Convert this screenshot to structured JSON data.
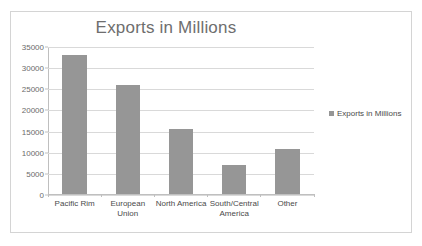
{
  "chart_data": {
    "type": "bar",
    "title": "Exports in Millions",
    "xlabel": "",
    "ylabel": "",
    "categories": [
      "Pacific Rim",
      "European Union",
      "North America",
      "South/Central America",
      "Other"
    ],
    "values": [
      33200,
      26000,
      15400,
      7000,
      10600
    ],
    "series": [
      {
        "name": "Exports in Millions",
        "values": [
          33200,
          26000,
          15400,
          7000,
          10600
        ]
      }
    ],
    "ylim": [
      0,
      35000
    ],
    "ytick_labels": [
      "35000",
      "30000",
      "25000",
      "20000",
      "15000",
      "10000",
      "5000",
      "0"
    ],
    "ytick_values": [
      35000,
      30000,
      25000,
      20000,
      15000,
      10000,
      5000,
      0
    ],
    "grid": true,
    "legend_position": "right",
    "legend_entries": [
      "Exports in Millions"
    ],
    "bar_color": "#969696",
    "gridline_color": "#d9d9d9",
    "axis_color": "#bfbfbf",
    "title_color": "#6e6e6e",
    "border_color": "#d4d4d4",
    "background_color": "#ffffff"
  }
}
